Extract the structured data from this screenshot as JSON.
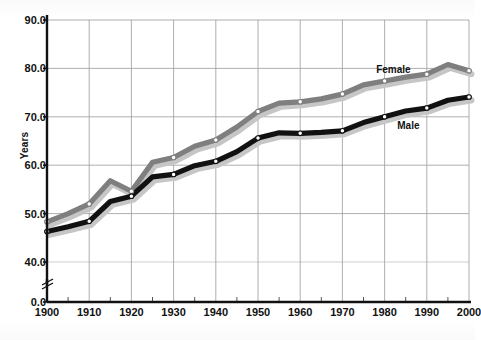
{
  "chart_data": {
    "type": "line",
    "title": "",
    "xlabel": "",
    "ylabel": "Years",
    "x": [
      1900,
      1905,
      1910,
      1915,
      1920,
      1925,
      1930,
      1935,
      1940,
      1945,
      1950,
      1955,
      1960,
      1965,
      1970,
      1975,
      1980,
      1985,
      1990,
      1995,
      2000
    ],
    "xlim": [
      1900,
      2000
    ],
    "ylim": [
      40.0,
      90.0
    ],
    "y_axis_break": true,
    "y_break_below": 40.0,
    "grid": true,
    "legend_position": "inline-labels",
    "xticks": [
      "1900",
      "1910",
      "1920",
      "1930",
      "1940",
      "1950",
      "1960",
      "1970",
      "1980",
      "1990",
      "2000"
    ],
    "xminor_ticks": [
      1905,
      1915,
      1925,
      1935,
      1945,
      1955,
      1965,
      1975,
      1985,
      1995
    ],
    "yticks": [
      "0.0",
      "40.0",
      "50.0",
      "60.0",
      "70.0",
      "80.0",
      "90.0"
    ],
    "ytick_values": [
      0.0,
      40.0,
      50.0,
      60.0,
      70.0,
      80.0,
      90.0
    ],
    "series": [
      {
        "name": "Female",
        "color": "#7f7f7f",
        "marker": "white-circle",
        "values": [
          48.3,
          50.0,
          52.0,
          56.8,
          54.6,
          60.6,
          61.6,
          63.9,
          65.2,
          67.9,
          71.1,
          72.8,
          73.1,
          73.7,
          74.7,
          76.6,
          77.4,
          78.2,
          78.8,
          80.8,
          79.5
        ]
      },
      {
        "name": "Male",
        "color": "#111111",
        "marker": "white-circle",
        "values": [
          46.3,
          47.3,
          48.4,
          52.5,
          53.6,
          57.6,
          58.1,
          59.9,
          60.8,
          62.8,
          65.6,
          66.7,
          66.6,
          66.8,
          67.1,
          68.8,
          70.0,
          71.2,
          71.8,
          73.4,
          74.1
        ]
      }
    ],
    "annotations": [
      {
        "text": "Female",
        "x": 1978,
        "y": 79.6
      },
      {
        "text": "Male",
        "x": 1983,
        "y": 68.1
      }
    ]
  }
}
